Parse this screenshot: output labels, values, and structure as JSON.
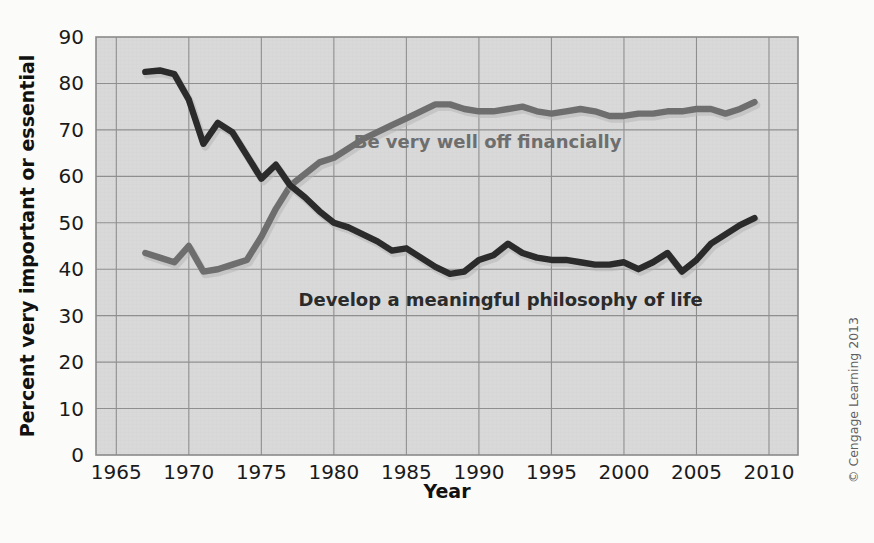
{
  "figure": {
    "background_color": "#fbfbfa",
    "plot_background_color": "#d9d9d9",
    "plot_border_color": "#8c8c8c",
    "grid_color": "#8f8f8f",
    "credit": "© Cengage Learning 2013"
  },
  "chart_data": {
    "type": "line",
    "title": "",
    "subtitle": "",
    "xlabel": "Year",
    "ylabel": "Percent very important or essential",
    "xlim": [
      1963.6,
      2012.0
    ],
    "ylim": [
      0,
      90
    ],
    "xticks": [
      1965,
      1970,
      1975,
      1980,
      1985,
      1990,
      1995,
      2000,
      2005,
      2010
    ],
    "xticklabels": [
      "1965",
      "1970",
      "1975",
      "1980",
      "1985",
      "1990",
      "1995",
      "2000",
      "2005",
      "2010"
    ],
    "yticks": [
      0,
      10,
      20,
      30,
      40,
      50,
      60,
      70,
      80,
      90
    ],
    "yticklabels": [
      "0",
      "10",
      "20",
      "30",
      "40",
      "50",
      "60",
      "70",
      "80",
      "90"
    ],
    "grid": true,
    "grid_x_step": 5,
    "grid_y_step": 10,
    "legend_position": "inline-annotations",
    "series": [
      {
        "name": "Be very well off financially",
        "color": "#6e6e6e",
        "label_color": "#6e6e6e",
        "label_x": 1990.6,
        "label_y": 66.0,
        "label_anchor": "middle",
        "x": [
          1967,
          1968,
          1969,
          1970,
          1971,
          1972,
          1973,
          1974,
          1975,
          1976,
          1977,
          1978,
          1979,
          1980,
          1981,
          1982,
          1983,
          1984,
          1985,
          1986,
          1987,
          1988,
          1989,
          1990,
          1991,
          1992,
          1993,
          1994,
          1995,
          1996,
          1997,
          1998,
          1999,
          2000,
          2001,
          2002,
          2003,
          2004,
          2005,
          2006,
          2007,
          2008,
          2009
        ],
        "y": [
          43.5,
          42.5,
          41.5,
          45.0,
          39.5,
          40.0,
          41.0,
          42.0,
          47.0,
          53.0,
          58.0,
          60.5,
          63.0,
          64.0,
          66.0,
          68.0,
          69.5,
          71.0,
          72.5,
          74.0,
          75.5,
          75.5,
          74.5,
          74.0,
          74.0,
          74.5,
          75.0,
          74.0,
          73.5,
          74.0,
          74.5,
          74.0,
          73.0,
          73.0,
          73.5,
          73.5,
          74.0,
          74.0,
          74.5,
          74.5,
          73.5,
          74.5,
          76.0
        ]
      },
      {
        "name": "Develop a meaningful philosophy of life",
        "color": "#2b2b2b",
        "label_color": "#2b2b2b",
        "label_x": 1991.5,
        "label_y": 32.0,
        "label_anchor": "middle",
        "x": [
          1967,
          1968,
          1969,
          1970,
          1971,
          1972,
          1973,
          1974,
          1975,
          1976,
          1977,
          1978,
          1979,
          1980,
          1981,
          1982,
          1983,
          1984,
          1985,
          1986,
          1987,
          1988,
          1989,
          1990,
          1991,
          1992,
          1993,
          1994,
          1995,
          1996,
          1997,
          1998,
          1999,
          2000,
          2001,
          2002,
          2003,
          2004,
          2005,
          2006,
          2007,
          2008,
          2009
        ],
        "y": [
          82.5,
          82.8,
          82.0,
          76.5,
          67.0,
          71.5,
          69.5,
          64.5,
          59.5,
          62.5,
          58.0,
          55.5,
          52.5,
          50.0,
          49.0,
          47.5,
          46.0,
          44.0,
          44.5,
          42.5,
          40.5,
          39.0,
          39.5,
          42.0,
          43.0,
          45.5,
          43.5,
          42.5,
          42.0,
          42.0,
          41.5,
          41.0,
          41.0,
          41.5,
          40.0,
          41.5,
          43.5,
          39.5,
          42.0,
          45.5,
          47.5,
          49.5,
          51.0
        ]
      }
    ]
  }
}
